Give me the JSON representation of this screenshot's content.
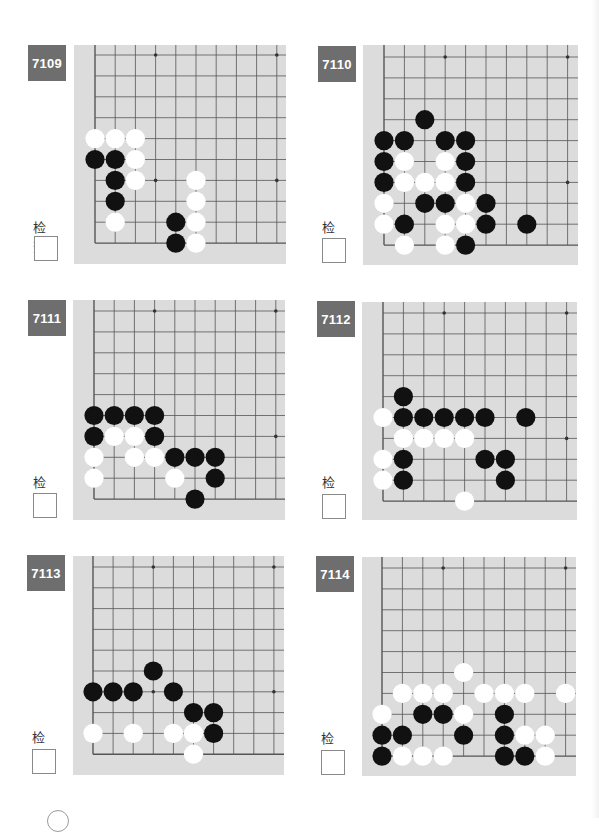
{
  "page": {
    "check_label": "检查",
    "colors": {
      "board_bg": "#dcdcdc",
      "grid_line": "#555555",
      "label_bg": "#6e6e6e",
      "black_stone": "#111111",
      "white_stone": "#ffffff"
    }
  },
  "problems": [
    {
      "id": "7109",
      "label_pos": [
        28,
        45
      ],
      "check_label_pos": [
        33,
        217
      ],
      "check_box_pos": [
        34,
        236
      ],
      "board": {
        "x": 74,
        "y": 45,
        "w": 212,
        "h": 219,
        "grid_x0": 21,
        "grid_y0": 10,
        "step_x": 20.2,
        "step_y": 20.9,
        "cols": 10,
        "rows": 10,
        "stars": [
          [
            3,
            0
          ],
          [
            9,
            0
          ],
          [
            3,
            6
          ],
          [
            9,
            6
          ]
        ],
        "black": [
          [
            0,
            5
          ],
          [
            1,
            5
          ],
          [
            1,
            6
          ],
          [
            1,
            7
          ],
          [
            4,
            8
          ],
          [
            4,
            9
          ]
        ],
        "white": [
          [
            0,
            4
          ],
          [
            1,
            4
          ],
          [
            2,
            4
          ],
          [
            2,
            5
          ],
          [
            2,
            6
          ],
          [
            5,
            6
          ],
          [
            5,
            7
          ],
          [
            1,
            8
          ],
          [
            5,
            8
          ],
          [
            5,
            9
          ]
        ]
      }
    },
    {
      "id": "7110",
      "label_pos": [
        318,
        46
      ],
      "check_label_pos": [
        322,
        217
      ],
      "check_box_pos": [
        322,
        238
      ],
      "board": {
        "x": 363,
        "y": 45,
        "w": 215,
        "h": 220,
        "grid_x0": 21,
        "grid_y0": 12,
        "step_x": 20.4,
        "step_y": 20.9,
        "cols": 10,
        "rows": 10,
        "stars": [
          [
            3,
            0
          ],
          [
            9,
            0
          ],
          [
            3,
            6
          ],
          [
            9,
            6
          ]
        ],
        "black": [
          [
            2,
            3
          ],
          [
            0,
            4
          ],
          [
            1,
            4
          ],
          [
            3,
            4
          ],
          [
            4,
            4
          ],
          [
            0,
            5
          ],
          [
            4,
            5
          ],
          [
            0,
            6
          ],
          [
            4,
            6
          ],
          [
            2,
            7
          ],
          [
            3,
            7
          ],
          [
            5,
            7
          ],
          [
            1,
            8
          ],
          [
            5,
            8
          ],
          [
            7,
            8
          ],
          [
            4,
            9
          ]
        ],
        "white": [
          [
            1,
            5
          ],
          [
            3,
            5
          ],
          [
            1,
            6
          ],
          [
            2,
            6
          ],
          [
            3,
            6
          ],
          [
            0,
            7
          ],
          [
            4,
            7
          ],
          [
            0,
            8
          ],
          [
            3,
            8
          ],
          [
            4,
            8
          ],
          [
            1,
            9
          ],
          [
            3,
            9
          ]
        ]
      }
    },
    {
      "id": "7111",
      "label_pos": [
        28,
        300
      ],
      "check_label_pos": [
        33,
        472
      ],
      "check_box_pos": [
        33,
        493
      ],
      "board": {
        "x": 73,
        "y": 300,
        "w": 212,
        "h": 220,
        "grid_x0": 21,
        "grid_y0": 11,
        "step_x": 20.2,
        "step_y": 20.9,
        "cols": 10,
        "rows": 10,
        "stars": [
          [
            3,
            0
          ],
          [
            9,
            0
          ],
          [
            3,
            6
          ],
          [
            9,
            6
          ]
        ],
        "black": [
          [
            0,
            5
          ],
          [
            1,
            5
          ],
          [
            2,
            5
          ],
          [
            3,
            5
          ],
          [
            0,
            6
          ],
          [
            3,
            6
          ],
          [
            4,
            7
          ],
          [
            5,
            7
          ],
          [
            6,
            7
          ],
          [
            6,
            8
          ],
          [
            5,
            9
          ]
        ],
        "white": [
          [
            1,
            6
          ],
          [
            2,
            6
          ],
          [
            0,
            7
          ],
          [
            2,
            7
          ],
          [
            3,
            7
          ],
          [
            0,
            8
          ],
          [
            4,
            8
          ]
        ]
      }
    },
    {
      "id": "7112",
      "label_pos": [
        317,
        301
      ],
      "check_label_pos": [
        322,
        472
      ],
      "check_box_pos": [
        322,
        494
      ],
      "board": {
        "x": 362,
        "y": 302,
        "w": 215,
        "h": 218,
        "grid_x0": 21,
        "grid_y0": 11,
        "step_x": 20.4,
        "step_y": 20.9,
        "cols": 10,
        "rows": 10,
        "stars": [
          [
            3,
            0
          ],
          [
            9,
            0
          ],
          [
            3,
            6
          ],
          [
            9,
            6
          ]
        ],
        "black": [
          [
            1,
            4
          ],
          [
            1,
            5
          ],
          [
            2,
            5
          ],
          [
            3,
            5
          ],
          [
            4,
            5
          ],
          [
            5,
            5
          ],
          [
            7,
            5
          ],
          [
            1,
            7
          ],
          [
            5,
            7
          ],
          [
            6,
            7
          ],
          [
            1,
            8
          ],
          [
            6,
            8
          ]
        ],
        "white": [
          [
            0,
            5
          ],
          [
            1,
            6
          ],
          [
            2,
            6
          ],
          [
            3,
            6
          ],
          [
            4,
            6
          ],
          [
            0,
            7
          ],
          [
            0,
            8
          ],
          [
            4,
            9
          ]
        ]
      }
    },
    {
      "id": "7113",
      "label_pos": [
        27,
        555
      ],
      "check_label_pos": [
        32,
        727
      ],
      "check_box_pos": [
        32,
        749
      ],
      "board": {
        "x": 73,
        "y": 556,
        "w": 211,
        "h": 219,
        "grid_x0": 20,
        "grid_y0": 11,
        "step_x": 20.1,
        "step_y": 20.8,
        "cols": 10,
        "rows": 10,
        "stars": [
          [
            3,
            0
          ],
          [
            9,
            0
          ],
          [
            3,
            6
          ],
          [
            9,
            6
          ]
        ],
        "black": [
          [
            3,
            5
          ],
          [
            0,
            6
          ],
          [
            1,
            6
          ],
          [
            2,
            6
          ],
          [
            4,
            6
          ],
          [
            5,
            7
          ],
          [
            6,
            7
          ],
          [
            6,
            8
          ]
        ],
        "white": [
          [
            0,
            8
          ],
          [
            2,
            8
          ],
          [
            4,
            8
          ],
          [
            5,
            8
          ],
          [
            5,
            9
          ]
        ]
      }
    },
    {
      "id": "7114",
      "label_pos": [
        316,
        556
      ],
      "check_label_pos": [
        321,
        728
      ],
      "check_box_pos": [
        321,
        750
      ],
      "board": {
        "x": 362,
        "y": 557,
        "w": 214,
        "h": 219,
        "grid_x0": 20,
        "grid_y0": 11,
        "step_x": 20.4,
        "step_y": 20.9,
        "cols": 10,
        "rows": 10,
        "stars": [
          [
            3,
            0
          ],
          [
            9,
            0
          ],
          [
            3,
            6
          ],
          [
            9,
            6
          ]
        ],
        "black": [
          [
            2,
            7
          ],
          [
            3,
            7
          ],
          [
            6,
            7
          ],
          [
            0,
            8
          ],
          [
            1,
            8
          ],
          [
            4,
            8
          ],
          [
            6,
            8
          ],
          [
            0,
            9
          ],
          [
            6,
            9
          ],
          [
            7,
            9
          ]
        ],
        "white": [
          [
            4,
            5
          ],
          [
            1,
            6
          ],
          [
            2,
            6
          ],
          [
            3,
            6
          ],
          [
            5,
            6
          ],
          [
            6,
            6
          ],
          [
            7,
            6
          ],
          [
            9,
            6
          ],
          [
            0,
            7
          ],
          [
            4,
            7
          ],
          [
            7,
            8
          ],
          [
            8,
            8
          ],
          [
            1,
            9
          ],
          [
            2,
            9
          ],
          [
            3,
            9
          ],
          [
            8,
            9
          ]
        ]
      }
    }
  ]
}
